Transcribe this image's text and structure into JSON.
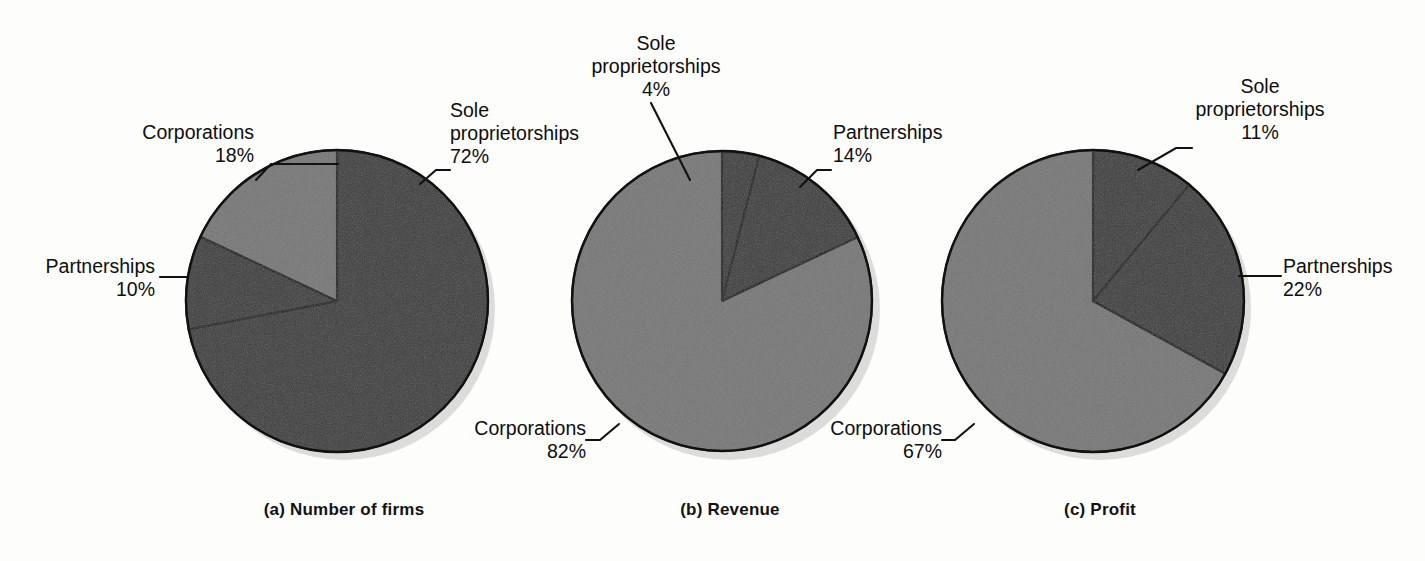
{
  "figure": {
    "background_color": "#fdfdfc",
    "slice_colors": {
      "dark": "#3a3a3a",
      "light": "#767676",
      "outline": "#111111",
      "shadow": "#d8d8d6"
    },
    "label_text_color": "#0d0d0d",
    "caption_text_color": "#121212"
  },
  "chart_data": [
    {
      "type": "pie",
      "title": "(a) Number of firms",
      "categories": [
        "Sole proprietorships",
        "Corporations",
        "Partnerships"
      ],
      "values": [
        72,
        18,
        10
      ],
      "value_labels": [
        "72%",
        "18%",
        "10%"
      ],
      "units": "percent",
      "start_angle_deg": 0,
      "direction": "clockwise",
      "legend": "none",
      "grid": false,
      "slices": [
        {
          "name": "Sole proprietorships",
          "value": 72,
          "value_label": "72%",
          "shade": "dark"
        },
        {
          "name": "Partnerships",
          "value": 10,
          "value_label": "10%",
          "shade": "dark"
        },
        {
          "name": "Corporations",
          "value": 18,
          "value_label": "18%",
          "shade": "light"
        }
      ]
    },
    {
      "type": "pie",
      "title": "(b) Revenue",
      "categories": [
        "Sole proprietorships",
        "Partnerships",
        "Corporations"
      ],
      "values": [
        4,
        14,
        82
      ],
      "value_labels": [
        "4%",
        "14%",
        "82%"
      ],
      "units": "percent",
      "start_angle_deg": 0,
      "direction": "clockwise",
      "legend": "none",
      "grid": false,
      "slices": [
        {
          "name": "Sole proprietorships",
          "value": 4,
          "value_label": "4%",
          "shade": "dark"
        },
        {
          "name": "Partnerships",
          "value": 14,
          "value_label": "14%",
          "shade": "dark"
        },
        {
          "name": "Corporations",
          "value": 82,
          "value_label": "82%",
          "shade": "light"
        }
      ]
    },
    {
      "type": "pie",
      "title": "(c) Profit",
      "categories": [
        "Sole proprietorships",
        "Partnerships",
        "Corporations"
      ],
      "values": [
        11,
        22,
        67
      ],
      "value_labels": [
        "11%",
        "22%",
        "67%"
      ],
      "units": "percent",
      "start_angle_deg": 0,
      "direction": "clockwise",
      "legend": "none",
      "grid": false,
      "slices": [
        {
          "name": "Sole proprietorships",
          "value": 11,
          "value_label": "11%",
          "shade": "dark"
        },
        {
          "name": "Partnerships",
          "value": 22,
          "value_label": "22%",
          "shade": "dark"
        },
        {
          "name": "Corporations",
          "value": 67,
          "value_label": "67%",
          "shade": "light"
        }
      ]
    }
  ],
  "panels": [
    {
      "caption": "(a) Number of firms",
      "labels": {
        "sole": "Sole\nproprietorships\n72%",
        "corporations": "Corporations\n18%",
        "partnerships": "Partnerships\n10%"
      }
    },
    {
      "caption": "(b) Revenue",
      "labels": {
        "sole": "Sole\nproprietorships\n4%",
        "partnerships": "Partnerships\n14%",
        "corporations": "Corporations\n82%"
      }
    },
    {
      "caption": "(c) Profit",
      "labels": {
        "sole": "Sole\nproprietorships\n11%",
        "partnerships": "Partnerships\n22%",
        "corporations": "Corporations\n67%"
      }
    }
  ]
}
